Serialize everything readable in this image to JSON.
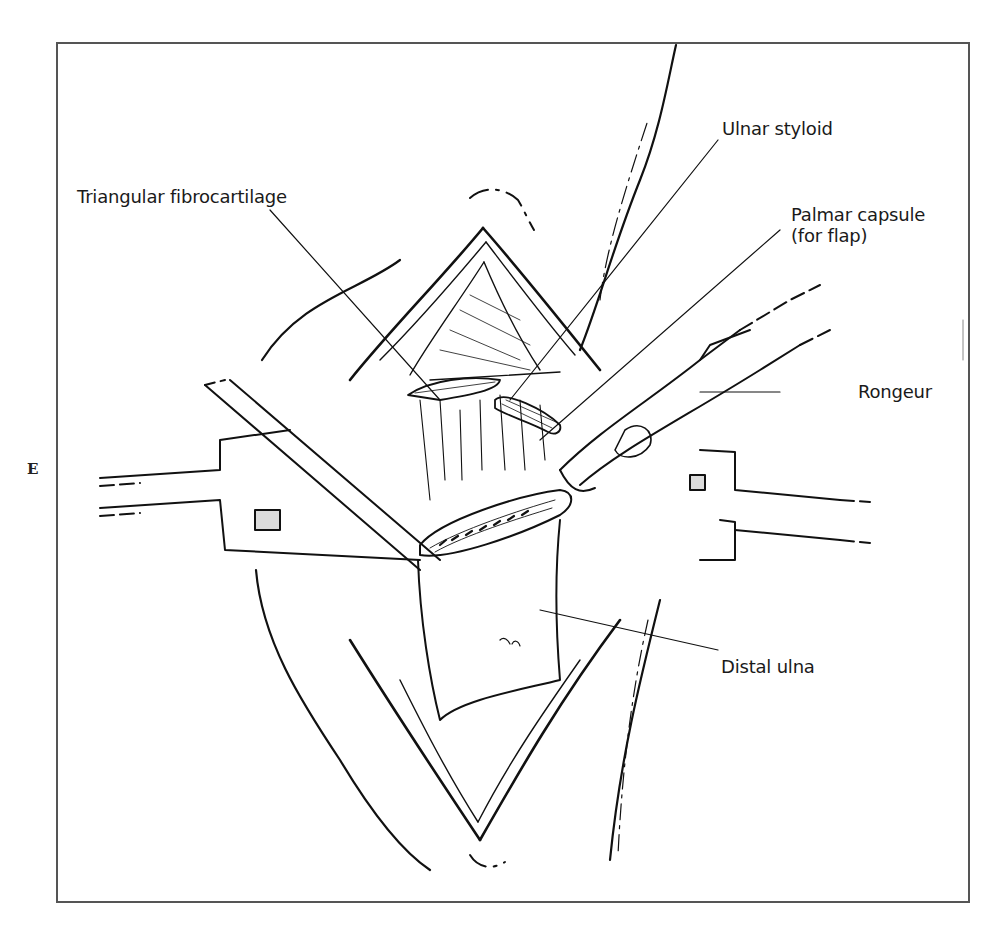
{
  "figure": {
    "panel_letter": "E",
    "labels": {
      "triangular_fibrocartilage": "Triangular fibrocartilage",
      "ulnar_styloid": "Ulnar styloid",
      "palmar_capsule_line1": "Palmar capsule",
      "palmar_capsule_line2": "(for flap)",
      "rongeur": "Rongeur",
      "distal_ulna": "Distal ulna"
    },
    "colors": {
      "ink": "#111111",
      "frame": "#555555",
      "background": "#ffffff"
    }
  }
}
